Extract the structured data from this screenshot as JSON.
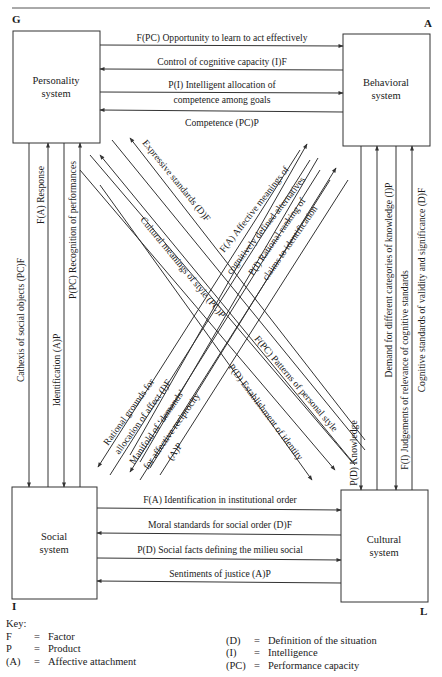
{
  "header": {
    "caption_partial": "Figure ... Interchange of the Action System"
  },
  "corners": {
    "top_left": "G",
    "top_right": "A",
    "bottom_left": "I",
    "bottom_right": "L"
  },
  "boxes": {
    "personality": [
      "Personality",
      "system"
    ],
    "behavioral": [
      "Behavioral",
      "system"
    ],
    "social": [
      "Social",
      "system"
    ],
    "cultural": [
      "Cultural",
      "system"
    ]
  },
  "top_flows": [
    {
      "text": "F(PC) Opportunity to learn to act effectively",
      "direction": "right"
    },
    {
      "text": "Control of cognitive capacity (I)F",
      "direction": "left"
    },
    {
      "text": [
        "P(I) Intelligent allocation of",
        "competence among goals"
      ],
      "direction": "right"
    },
    {
      "text": "Competence (PC)P",
      "direction": "left"
    }
  ],
  "bottom_flows": [
    {
      "text": "F(A) Identification in institutional order",
      "direction": "right"
    },
    {
      "text": "Moral standards for social order (D)F",
      "direction": "left"
    },
    {
      "text": "P(D) Social facts defining the milieu social",
      "direction": "right"
    },
    {
      "text": "Sentiments of justice (A)P",
      "direction": "left"
    }
  ],
  "left_flows": [
    {
      "text": "Cathexis of social objects (PC)F",
      "direction": "down"
    },
    {
      "text": "F(A) Response",
      "direction": "up"
    },
    {
      "text": "Identification (A)P",
      "direction": "down"
    },
    {
      "text": "P(PC) Recognition of performances",
      "direction": "up"
    }
  ],
  "right_flows": [
    {
      "text": "P(D) Knowledge",
      "direction": "down"
    },
    {
      "text": "Demand for different categories of knowledge (I)P",
      "direction": "up"
    },
    {
      "text": "F(I) Judgements of relevance of cognitive standards",
      "direction": "down"
    },
    {
      "text": "Cognitive standards of validity and significance (D)F",
      "direction": "up"
    }
  ],
  "diagonal_flows": {
    "cultural_to_personality": [
      {
        "text": "Cultural meanings of style (PC)P",
        "direction": "to-personality"
      },
      {
        "text": "Expressive standards (D)F",
        "direction": "to-personality"
      }
    ],
    "personality_to_cultural": [
      {
        "text": "F(PC) Patterns of personal style",
        "direction": "to-cultural"
      },
      {
        "text": "P(D) Establishment of identity",
        "direction": "to-cultural"
      }
    ],
    "social_to_behavioral": [
      {
        "text": "F(A) Affective meanings of",
        "direction": "to-behavioral"
      },
      {
        "text": "cognitively defined alternatives",
        "direction": "none"
      },
      {
        "text": "P(I) Rational ranking of",
        "direction": "to-behavioral"
      },
      {
        "text": "claims to identification",
        "direction": "none"
      }
    ],
    "behavioral_to_social": [
      {
        "text": "Rational grounds for",
        "direction": "to-social"
      },
      {
        "text": "allocation of affect (I)F",
        "direction": "none"
      },
      {
        "text": "Manifold of ‘demands’",
        "direction": "to-social"
      },
      {
        "text": "for affective reciprocity",
        "direction": "none"
      },
      {
        "text": "(A)P",
        "direction": "none"
      }
    ]
  },
  "key": {
    "title": "Key:",
    "left": [
      {
        "sym": "F",
        "eq": "=",
        "desc": "Factor"
      },
      {
        "sym": "P",
        "eq": "=",
        "desc": "Product"
      },
      {
        "sym": "(A)",
        "eq": "=",
        "desc": "Affective attachment"
      }
    ],
    "right": [
      {
        "sym": "(D)",
        "eq": "=",
        "desc": "Definition of the situation"
      },
      {
        "sym": "(I)",
        "eq": "=",
        "desc": "Intelligence"
      },
      {
        "sym": "(PC)",
        "eq": "=",
        "desc": "Performance capacity"
      }
    ]
  },
  "colors": {
    "ink": "#1a1a1a",
    "line": "#333333",
    "paper": "#ffffff"
  }
}
